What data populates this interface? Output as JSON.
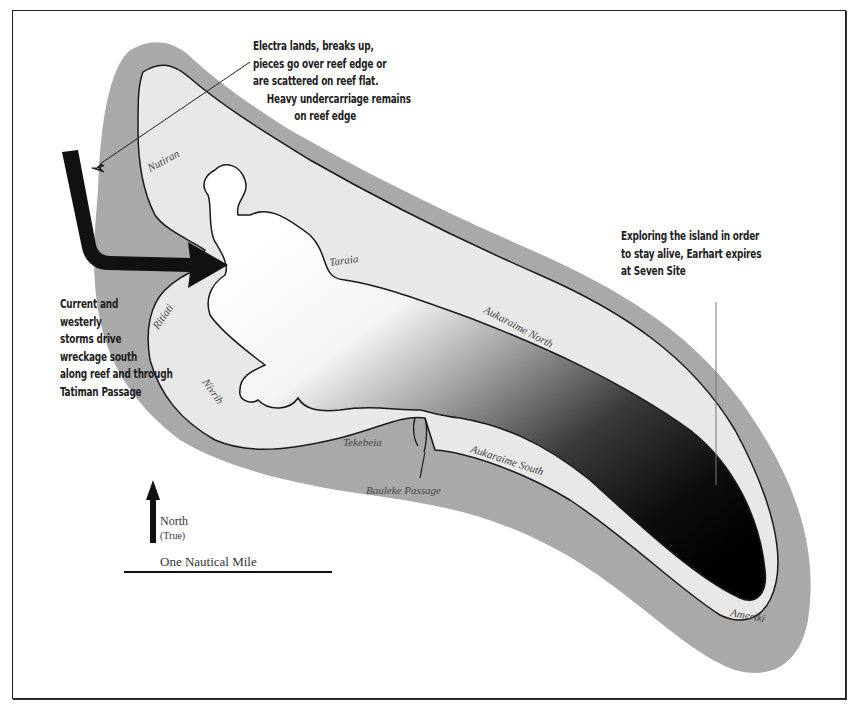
{
  "map": {
    "subject": "Atoll wreck scenario map",
    "colors": {
      "reef": "#a9a9a9",
      "land": "#e9e9e9",
      "lagoon_light": "#ffffff",
      "lagoon_dark": "#0a0a0a",
      "arrow": "#111111",
      "outline": "#1a1a1a"
    },
    "annotations": {
      "crash": {
        "lines": [
          "Electra lands, breaks up,",
          "pieces go over reef edge or",
          "are scattered on reef flat.",
          "Heavy undercarriage remains",
          "on reef edge"
        ]
      },
      "current": {
        "lines": [
          "Current and",
          "westerly",
          "storms drive",
          "wreckage south",
          "along reef and through",
          "Tatiman Passage"
        ]
      },
      "seven_site": {
        "lines": [
          "Exploring the island in order",
          "to stay alive, Earhart expires",
          "at Seven Site"
        ]
      }
    },
    "place_labels": {
      "nutiran": "Nutiran",
      "taraia": "Taraia",
      "aukaraime_north": "Aukaraime North",
      "ritiati": "Ritiati",
      "nivrih": "Nivrih",
      "tekebeia": "Tekebeia",
      "bauleke_passage": "Bauleke Passage",
      "aukaraime_south": "Aukaraime South",
      "ameriki": "Ameriki"
    },
    "legend": {
      "north_label": "North",
      "north_sub": "(True)",
      "scale_label": "One Nautical Mile"
    }
  }
}
